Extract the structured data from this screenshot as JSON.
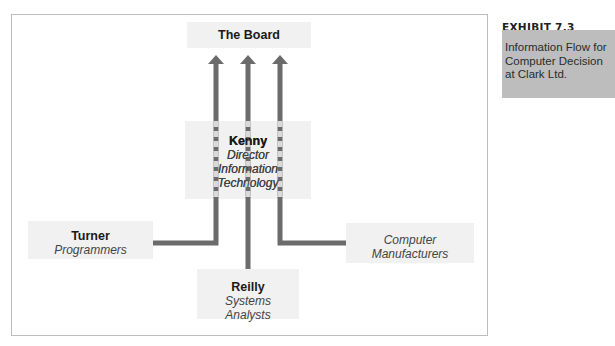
{
  "exhibit": {
    "number": "EXHIBIT 7.3",
    "title": "Information Flow for Computer Decision at Clark Ltd."
  },
  "nodes": {
    "board": {
      "name": "The Board"
    },
    "kenny": {
      "name": "Kenny",
      "role": [
        "Director",
        "Information",
        "Technology"
      ]
    },
    "turner": {
      "name": "Turner",
      "role": [
        "Programmers"
      ]
    },
    "reilly": {
      "name": "Reilly",
      "role": [
        "Systems",
        "Analysts"
      ]
    },
    "manufacturers": {
      "role": [
        "Computer",
        "Manufacturers"
      ]
    }
  },
  "flows": [
    {
      "from": "Turner",
      "to": "The Board"
    },
    {
      "from": "Reilly",
      "to": "The Board"
    },
    {
      "from": "Computer Manufacturers",
      "to": "The Board"
    }
  ],
  "colors": {
    "arrow": "#6b6b6b",
    "node_fill": "#f1f1f1",
    "exhibit_fill": "#bdbdbd",
    "frame": "#bdbdbd"
  }
}
